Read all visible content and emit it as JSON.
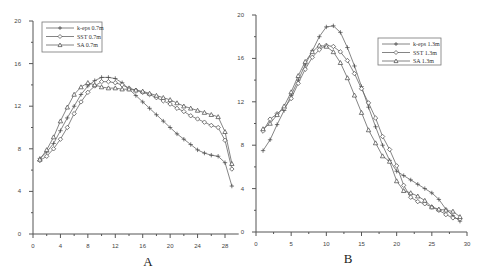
{
  "chart_data": [
    {
      "type": "line",
      "panel_label": "A",
      "title": "",
      "xlabel": "A",
      "ylabel": "",
      "xlim": [
        0,
        30
      ],
      "ylim": [
        0,
        20
      ],
      "xticks": [
        0,
        4,
        8,
        12,
        16,
        20,
        24,
        28
      ],
      "yticks": [
        0,
        4,
        8,
        12,
        16,
        20
      ],
      "grid": false,
      "legend_position": "upper-left",
      "x": [
        1,
        2,
        3,
        4,
        5,
        6,
        7,
        8,
        9,
        10,
        11,
        12,
        13,
        14,
        15,
        16,
        17,
        18,
        19,
        20,
        21,
        22,
        23,
        24,
        25,
        26,
        27,
        28,
        29
      ],
      "series": [
        {
          "name": "k-eps 0.7m",
          "marker": "plus",
          "values": [
            7.1,
            7.7,
            8.5,
            9.7,
            10.9,
            12.0,
            13.1,
            13.9,
            14.4,
            14.7,
            14.7,
            14.6,
            14.2,
            13.6,
            13.0,
            12.4,
            11.8,
            11.2,
            10.6,
            10.0,
            9.4,
            8.9,
            8.4,
            7.9,
            7.6,
            7.4,
            7.3,
            6.7,
            4.5
          ]
        },
        {
          "name": "SST 0.7m",
          "marker": "diamond",
          "values": [
            6.9,
            7.3,
            8.0,
            8.9,
            10.0,
            11.3,
            12.4,
            13.3,
            13.9,
            14.3,
            14.3,
            14.2,
            14.0,
            13.7,
            13.5,
            13.3,
            13.1,
            12.8,
            12.5,
            12.2,
            11.8,
            11.5,
            11.1,
            10.8,
            10.5,
            10.2,
            10.0,
            8.8,
            6.1
          ]
        },
        {
          "name": "SA 0.7m",
          "marker": "triangle",
          "values": [
            7.0,
            7.9,
            9.1,
            10.6,
            11.9,
            13.1,
            13.8,
            14.2,
            14.0,
            13.8,
            13.7,
            13.7,
            13.6,
            13.6,
            13.5,
            13.4,
            13.2,
            13.0,
            12.8,
            12.6,
            12.3,
            12.0,
            11.8,
            11.6,
            11.4,
            11.2,
            11.0,
            9.6,
            6.6
          ]
        }
      ]
    },
    {
      "type": "line",
      "panel_label": "B",
      "title": "",
      "xlabel": "B",
      "ylabel": "",
      "xlim": [
        0,
        30
      ],
      "ylim": [
        0,
        20
      ],
      "xticks": [
        0,
        5,
        10,
        15,
        20,
        25,
        30
      ],
      "yticks": [
        0,
        4,
        8,
        12,
        16,
        20
      ],
      "grid": false,
      "legend_position": "upper-right",
      "x": [
        1,
        2,
        3,
        4,
        5,
        6,
        7,
        8,
        9,
        10,
        11,
        12,
        13,
        14,
        15,
        16,
        17,
        18,
        19,
        20,
        21,
        22,
        23,
        24,
        25,
        26,
        27,
        28,
        29
      ],
      "series": [
        {
          "name": "k-eps 1.3m",
          "marker": "plus",
          "values": [
            7.5,
            8.5,
            9.9,
            11.2,
            12.6,
            14.0,
            15.4,
            16.7,
            18.0,
            18.9,
            19.0,
            18.4,
            17.0,
            15.3,
            13.4,
            11.5,
            9.7,
            8.0,
            6.6,
            5.6,
            5.2,
            4.8,
            4.4,
            4.0,
            3.6,
            3.0,
            2.1,
            1.5,
            1.0
          ]
        },
        {
          "name": "SST 1.3m",
          "marker": "diamond",
          "values": [
            9.3,
            10.4,
            10.9,
            11.4,
            12.3,
            13.7,
            15.0,
            16.1,
            16.8,
            17.2,
            17.1,
            16.6,
            15.8,
            14.6,
            13.2,
            11.9,
            10.5,
            8.8,
            7.6,
            6.1,
            4.3,
            3.2,
            2.8,
            2.6,
            2.3,
            2.0,
            1.6,
            1.3,
            1.2
          ]
        },
        {
          "name": "SA 1.3m",
          "marker": "triangle",
          "values": [
            9.5,
            10.0,
            10.8,
            11.6,
            12.9,
            14.4,
            15.7,
            16.6,
            17.2,
            17.1,
            16.6,
            15.6,
            14.2,
            12.6,
            11.0,
            9.4,
            8.2,
            7.0,
            6.5,
            4.7,
            3.8,
            3.6,
            3.3,
            2.9,
            2.3,
            2.1,
            2.0,
            1.9,
            1.4
          ]
        }
      ]
    }
  ],
  "panels": {
    "a": {
      "label": "A"
    },
    "b": {
      "label": "B"
    }
  }
}
